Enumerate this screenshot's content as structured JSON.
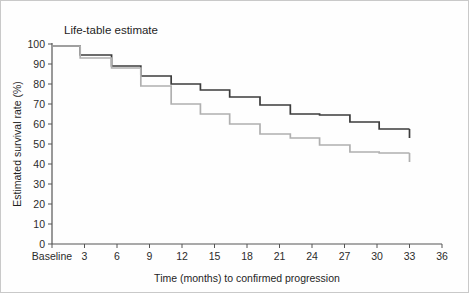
{
  "chart_data": {
    "type": "line",
    "title": "Life-table estimate",
    "xlabel": "Time (months) to confirmed progression",
    "ylabel": "Estimated survival rate (%)",
    "xlim": [
      0,
      36
    ],
    "ylim": [
      0,
      100
    ],
    "grid": false,
    "legend": "none",
    "x_tick_values": [
      0,
      3,
      6,
      9,
      12,
      15,
      18,
      21,
      24,
      27,
      30,
      33,
      36
    ],
    "x_tick_labels": [
      "Baseline",
      "3",
      "6",
      "9",
      "12",
      "15",
      "18",
      "21",
      "24",
      "27",
      "30",
      "33",
      "36"
    ],
    "y_tick_values": [
      0,
      10,
      20,
      30,
      40,
      50,
      60,
      70,
      80,
      90,
      100
    ],
    "y_tick_labels": [
      "0",
      "10",
      "20",
      "30",
      "40",
      "50",
      "60",
      "70",
      "80",
      "90",
      "100"
    ],
    "series": [
      {
        "name": "upper-curve",
        "color": "#3c3c3c",
        "style": "step",
        "x": [
          0,
          2.6,
          2.6,
          5.5,
          5.5,
          8.2,
          8.2,
          11.0,
          11.0,
          13.7,
          13.7,
          16.4,
          16.4,
          19.2,
          19.2,
          22.0,
          22.0,
          24.7,
          24.7,
          27.5,
          27.5,
          30.2,
          30.2,
          33.0
        ],
        "y": [
          99,
          99,
          94.5,
          94.5,
          89,
          89,
          84,
          84,
          80,
          80,
          77,
          77,
          73.5,
          73.5,
          69.5,
          69.5,
          65,
          65,
          64.5,
          64.5,
          61,
          61,
          57.5,
          57.5
        ],
        "endpoint_value": 57.5,
        "start_value": 99
      },
      {
        "name": "lower-curve",
        "color": "#b0b0b0",
        "style": "step",
        "x": [
          0,
          2.6,
          2.6,
          5.5,
          5.5,
          8.2,
          8.2,
          11.0,
          11.0,
          13.7,
          13.7,
          16.4,
          16.4,
          19.2,
          19.2,
          22.0,
          22.0,
          24.7,
          24.7,
          27.5,
          27.5,
          30.2,
          30.2,
          33.0
        ],
        "y": [
          99,
          99,
          93,
          93,
          88,
          88,
          79,
          79,
          70,
          70,
          65,
          65,
          60,
          60,
          55,
          55,
          53,
          53,
          49.5,
          49.5,
          46,
          46,
          45.5,
          45.5
        ],
        "endpoint_value": 45.5,
        "start_value": 99
      }
    ]
  }
}
